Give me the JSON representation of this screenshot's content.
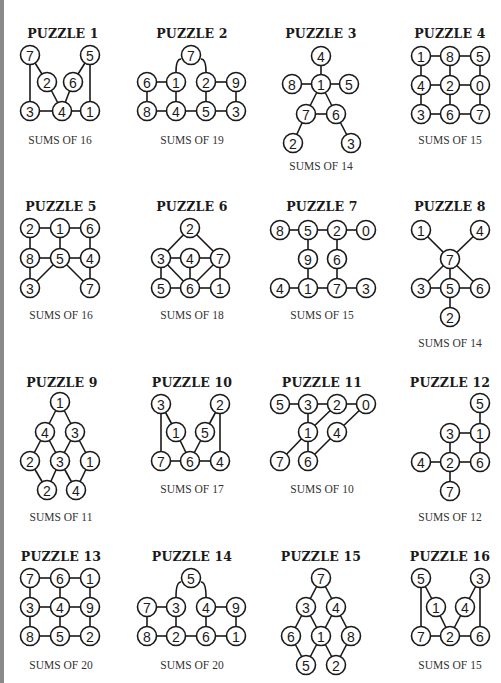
{
  "page": {
    "left_border_color": "#8a8a8a"
  },
  "puzzles": [
    {
      "title": "PUZZLE 1",
      "sums": "SUMS OF 16",
      "tx": 63,
      "ty": 34,
      "sx": 60,
      "sy": 141,
      "nodes": [
        [
          "7",
          30,
          55
        ],
        [
          "5",
          90,
          55
        ],
        [
          "2",
          47,
          82
        ],
        [
          "6",
          73,
          82
        ],
        [
          "3",
          30,
          111
        ],
        [
          "4",
          62,
          111
        ],
        [
          "1",
          90,
          111
        ]
      ],
      "edges": [
        [
          0,
          4
        ],
        [
          0,
          2
        ],
        [
          2,
          5
        ],
        [
          1,
          3
        ],
        [
          1,
          6
        ],
        [
          3,
          5
        ],
        [
          4,
          5
        ],
        [
          5,
          6
        ]
      ]
    },
    {
      "title": "PUZZLE 2",
      "sums": "SUMS OF 19",
      "tx": 192,
      "ty": 34,
      "sx": 192,
      "sy": 141,
      "nodes": [
        [
          "7",
          191,
          55
        ],
        [
          "6",
          147,
          82
        ],
        [
          "1",
          176,
          82
        ],
        [
          "2",
          206,
          82
        ],
        [
          "9",
          236,
          82
        ],
        [
          "8",
          147,
          111
        ],
        [
          "4",
          176,
          111
        ],
        [
          "5",
          206,
          111
        ],
        [
          "3",
          236,
          111
        ]
      ],
      "edges": [
        [
          1,
          2
        ],
        [
          3,
          4
        ],
        [
          1,
          5
        ],
        [
          2,
          6
        ],
        [
          3,
          7
        ],
        [
          4,
          8
        ],
        [
          5,
          6
        ],
        [
          6,
          7
        ],
        [
          7,
          8
        ]
      ],
      "arcs": [
        [
          176,
          72,
          181,
          59
        ],
        [
          206,
          72,
          201,
          59
        ]
      ]
    },
    {
      "title": "PUZZLE 3",
      "sums": "SUMS OF 14",
      "tx": 321,
      "ty": 34,
      "sx": 321,
      "sy": 167,
      "nodes": [
        [
          "4",
          321,
          56
        ],
        [
          "8",
          292,
          84
        ],
        [
          "1",
          321,
          84
        ],
        [
          "5",
          349,
          84
        ],
        [
          "7",
          306,
          114
        ],
        [
          "6",
          336,
          114
        ],
        [
          "2",
          293,
          143
        ],
        [
          "3",
          351,
          143
        ]
      ],
      "edges": [
        [
          0,
          2
        ],
        [
          1,
          2
        ],
        [
          2,
          3
        ],
        [
          2,
          4
        ],
        [
          2,
          5
        ],
        [
          4,
          5
        ],
        [
          4,
          6
        ],
        [
          5,
          7
        ]
      ]
    },
    {
      "title": "PUZZLE 4",
      "sums": "SUMS OF 15",
      "tx": 450,
      "ty": 34,
      "sx": 450,
      "sy": 141,
      "nodes": [
        [
          "1",
          421,
          56
        ],
        [
          "8",
          450,
          56
        ],
        [
          "5",
          480,
          56
        ],
        [
          "4",
          421,
          85
        ],
        [
          "2",
          450,
          85
        ],
        [
          "0",
          480,
          85
        ],
        [
          "3",
          421,
          114
        ],
        [
          "6",
          450,
          114
        ],
        [
          "7",
          480,
          114
        ]
      ],
      "edges": [
        [
          0,
          1
        ],
        [
          1,
          2
        ],
        [
          3,
          4
        ],
        [
          4,
          5
        ],
        [
          6,
          7
        ],
        [
          7,
          8
        ],
        [
          0,
          3
        ],
        [
          3,
          6
        ],
        [
          1,
          4
        ],
        [
          4,
          7
        ],
        [
          2,
          5
        ],
        [
          5,
          8
        ]
      ]
    },
    {
      "title": "PUZZLE 5",
      "sums": "SUMS OF 16",
      "tx": 61,
      "ty": 207,
      "sx": 61,
      "sy": 316,
      "nodes": [
        [
          "2",
          30,
          228
        ],
        [
          "1",
          60,
          228
        ],
        [
          "6",
          90,
          228
        ],
        [
          "8",
          30,
          258
        ],
        [
          "5",
          60,
          258
        ],
        [
          "4",
          90,
          258
        ],
        [
          "3",
          30,
          288
        ],
        [
          "7",
          90,
          288
        ]
      ],
      "edges": [
        [
          0,
          1
        ],
        [
          1,
          2
        ],
        [
          3,
          4
        ],
        [
          4,
          5
        ],
        [
          0,
          3
        ],
        [
          1,
          4
        ],
        [
          2,
          5
        ],
        [
          3,
          6
        ],
        [
          5,
          7
        ],
        [
          4,
          6
        ],
        [
          4,
          7
        ]
      ]
    },
    {
      "title": "PUZZLE 6",
      "sums": "SUMS OF 18",
      "tx": 192,
      "ty": 207,
      "sx": 192,
      "sy": 316,
      "nodes": [
        [
          "2",
          190,
          228
        ],
        [
          "3",
          161,
          258
        ],
        [
          "4",
          190,
          258
        ],
        [
          "7",
          220,
          258
        ],
        [
          "5",
          161,
          288
        ],
        [
          "6",
          190,
          288
        ],
        [
          "1",
          220,
          288
        ]
      ],
      "edges": [
        [
          0,
          1
        ],
        [
          0,
          3
        ],
        [
          1,
          2
        ],
        [
          2,
          3
        ],
        [
          1,
          4
        ],
        [
          1,
          5
        ],
        [
          2,
          5
        ],
        [
          3,
          5
        ],
        [
          3,
          6
        ],
        [
          4,
          5
        ],
        [
          5,
          6
        ]
      ]
    },
    {
      "title": "PUZZLE 7",
      "sums": "SUMS OF 15",
      "tx": 322,
      "ty": 207,
      "sx": 322,
      "sy": 316,
      "nodes": [
        [
          "8",
          280,
          230
        ],
        [
          "5",
          308,
          230
        ],
        [
          "2",
          337,
          230
        ],
        [
          "0",
          366,
          230
        ],
        [
          "9",
          308,
          259
        ],
        [
          "6",
          337,
          259
        ],
        [
          "4",
          280,
          288
        ],
        [
          "1",
          308,
          288
        ],
        [
          "7",
          337,
          288
        ],
        [
          "3",
          366,
          288
        ]
      ],
      "edges": [
        [
          0,
          1
        ],
        [
          1,
          2
        ],
        [
          2,
          3
        ],
        [
          1,
          4
        ],
        [
          2,
          5
        ],
        [
          4,
          7
        ],
        [
          5,
          8
        ],
        [
          6,
          7
        ],
        [
          7,
          8
        ],
        [
          8,
          9
        ]
      ]
    },
    {
      "title": "PUZZLE 8",
      "sums": "SUMS OF 14",
      "tx": 450,
      "ty": 207,
      "sx": 450,
      "sy": 344,
      "nodes": [
        [
          "1",
          421,
          230
        ],
        [
          "4",
          480,
          230
        ],
        [
          "7",
          450,
          259
        ],
        [
          "3",
          421,
          288
        ],
        [
          "5",
          450,
          288
        ],
        [
          "6",
          480,
          288
        ],
        [
          "2",
          450,
          317
        ]
      ],
      "edges": [
        [
          0,
          2
        ],
        [
          1,
          2
        ],
        [
          2,
          3
        ],
        [
          2,
          4
        ],
        [
          2,
          5
        ],
        [
          3,
          4
        ],
        [
          4,
          5
        ],
        [
          4,
          6
        ]
      ]
    },
    {
      "title": "PUZZLE 9",
      "sums": "SUMS OF 11",
      "tx": 62,
      "ty": 383,
      "sx": 61,
      "sy": 518,
      "nodes": [
        [
          "1",
          60,
          402
        ],
        [
          "4",
          45,
          432
        ],
        [
          "3",
          75,
          432
        ],
        [
          "2",
          30,
          461
        ],
        [
          "3",
          60,
          461
        ],
        [
          "1",
          90,
          461
        ],
        [
          "2",
          47,
          490
        ],
        [
          "4",
          76,
          490
        ]
      ],
      "edges": [
        [
          0,
          1
        ],
        [
          0,
          2
        ],
        [
          1,
          3
        ],
        [
          1,
          4
        ],
        [
          2,
          4
        ],
        [
          2,
          5
        ],
        [
          3,
          6
        ],
        [
          4,
          6
        ],
        [
          4,
          7
        ],
        [
          5,
          7
        ]
      ]
    },
    {
      "title": "PUZZLE 10",
      "sums": "SUMS OF 17",
      "tx": 192,
      "ty": 383,
      "sx": 192,
      "sy": 490,
      "nodes": [
        [
          "3",
          161,
          404
        ],
        [
          "2",
          220,
          404
        ],
        [
          "1",
          176,
          432
        ],
        [
          "5",
          205,
          432
        ],
        [
          "7",
          161,
          461
        ],
        [
          "6",
          190,
          461
        ],
        [
          "4",
          220,
          461
        ]
      ],
      "edges": [
        [
          0,
          4
        ],
        [
          0,
          2
        ],
        [
          2,
          5
        ],
        [
          1,
          3
        ],
        [
          1,
          6
        ],
        [
          3,
          5
        ],
        [
          4,
          5
        ],
        [
          5,
          6
        ]
      ]
    },
    {
      "title": "PUZZLE 11",
      "sums": "SUMS OF 10",
      "tx": 322,
      "ty": 383,
      "sx": 322,
      "sy": 490,
      "nodes": [
        [
          "5",
          280,
          404
        ],
        [
          "3",
          308,
          404
        ],
        [
          "2",
          337,
          404
        ],
        [
          "0",
          366,
          404
        ],
        [
          "1",
          308,
          432
        ],
        [
          "4",
          337,
          432
        ],
        [
          "7",
          280,
          461
        ],
        [
          "6",
          308,
          461
        ]
      ],
      "edges": [
        [
          0,
          1
        ],
        [
          1,
          2
        ],
        [
          2,
          3
        ],
        [
          1,
          4
        ],
        [
          2,
          4
        ],
        [
          4,
          6
        ],
        [
          4,
          7
        ],
        [
          3,
          5
        ],
        [
          5,
          7
        ]
      ]
    },
    {
      "title": "PUZZLE 12",
      "sums": "SUMS OF 12",
      "tx": 450,
      "ty": 383,
      "sx": 450,
      "sy": 518,
      "nodes": [
        [
          "5",
          480,
          403
        ],
        [
          "3",
          450,
          433
        ],
        [
          "1",
          480,
          433
        ],
        [
          "4",
          421,
          462
        ],
        [
          "2",
          450,
          462
        ],
        [
          "6",
          480,
          462
        ],
        [
          "7",
          450,
          491
        ]
      ],
      "edges": [
        [
          0,
          2
        ],
        [
          1,
          2
        ],
        [
          1,
          4
        ],
        [
          2,
          5
        ],
        [
          3,
          4
        ],
        [
          4,
          5
        ],
        [
          4,
          6
        ]
      ]
    },
    {
      "title": "PUZZLE 13",
      "sums": "SUMS OF 20",
      "tx": 61,
      "ty": 557,
      "sx": 61,
      "sy": 666,
      "nodes": [
        [
          "7",
          30,
          578
        ],
        [
          "6",
          60,
          578
        ],
        [
          "1",
          90,
          578
        ],
        [
          "3",
          30,
          607
        ],
        [
          "4",
          60,
          607
        ],
        [
          "9",
          90,
          607
        ],
        [
          "8",
          30,
          636
        ],
        [
          "5",
          60,
          636
        ],
        [
          "2",
          90,
          636
        ]
      ],
      "edges": [
        [
          0,
          1
        ],
        [
          1,
          2
        ],
        [
          3,
          4
        ],
        [
          4,
          5
        ],
        [
          6,
          7
        ],
        [
          7,
          8
        ],
        [
          0,
          3
        ],
        [
          3,
          6
        ],
        [
          1,
          4
        ],
        [
          4,
          7
        ],
        [
          2,
          5
        ],
        [
          5,
          8
        ]
      ]
    },
    {
      "title": "PUZZLE 14",
      "sums": "SUMS OF 20",
      "tx": 192,
      "ty": 557,
      "sx": 192,
      "sy": 666,
      "nodes": [
        [
          "5",
          191,
          578
        ],
        [
          "7",
          147,
          607
        ],
        [
          "3",
          176,
          607
        ],
        [
          "4",
          206,
          607
        ],
        [
          "9",
          236,
          607
        ],
        [
          "8",
          147,
          636
        ],
        [
          "2",
          176,
          636
        ],
        [
          "6",
          206,
          636
        ],
        [
          "1",
          236,
          636
        ]
      ],
      "edges": [
        [
          1,
          2
        ],
        [
          3,
          4
        ],
        [
          1,
          5
        ],
        [
          2,
          6
        ],
        [
          3,
          7
        ],
        [
          4,
          8
        ],
        [
          5,
          6
        ],
        [
          6,
          7
        ],
        [
          7,
          8
        ]
      ],
      "arcs": [
        [
          176,
          597,
          181,
          582
        ],
        [
          206,
          597,
          201,
          582
        ]
      ]
    },
    {
      "title": "PUZZLE 15",
      "sums": "",
      "tx": 321,
      "ty": 557,
      "sx": 321,
      "sy": 690,
      "nodes": [
        [
          "7",
          321,
          578
        ],
        [
          "3",
          306,
          607
        ],
        [
          "4",
          336,
          607
        ],
        [
          "6",
          291,
          636
        ],
        [
          "1",
          321,
          636
        ],
        [
          "8",
          351,
          636
        ],
        [
          "5",
          306,
          665
        ],
        [
          "2",
          336,
          665
        ]
      ],
      "edges": [
        [
          0,
          1
        ],
        [
          0,
          2
        ],
        [
          1,
          3
        ],
        [
          1,
          4
        ],
        [
          2,
          4
        ],
        [
          2,
          5
        ],
        [
          3,
          6
        ],
        [
          4,
          6
        ],
        [
          4,
          7
        ],
        [
          5,
          7
        ]
      ]
    },
    {
      "title": "PUZZLE 16",
      "sums": "SUMS OF 15",
      "tx": 450,
      "ty": 557,
      "sx": 450,
      "sy": 666,
      "nodes": [
        [
          "5",
          421,
          578
        ],
        [
          "3",
          480,
          578
        ],
        [
          "1",
          436,
          607
        ],
        [
          "4",
          465,
          607
        ],
        [
          "7",
          421,
          636
        ],
        [
          "2",
          450,
          636
        ],
        [
          "6",
          480,
          636
        ]
      ],
      "edges": [
        [
          0,
          4
        ],
        [
          0,
          2
        ],
        [
          2,
          5
        ],
        [
          1,
          3
        ],
        [
          1,
          6
        ],
        [
          3,
          5
        ],
        [
          4,
          5
        ],
        [
          5,
          6
        ]
      ]
    }
  ]
}
